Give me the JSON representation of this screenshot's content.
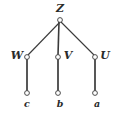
{
  "figure": {
    "type": "tree-diagram",
    "background_color": "#ffffff",
    "stroke_color": "#3a3a3a",
    "label_color": "#2a2a2a",
    "node_fill": "#ffffff"
  },
  "nodes": [
    {
      "id": "Z",
      "label": "Z",
      "cx": 60,
      "cy": 20,
      "r": 2.4,
      "label_x": 60,
      "label_y": 3,
      "label_anchor": "center",
      "level": "root",
      "size": "upper"
    },
    {
      "id": "W",
      "label": "W",
      "cx": 27,
      "cy": 57,
      "r": 2.4,
      "label_x": 17,
      "label_y": 50,
      "label_anchor": "center",
      "level": "internal",
      "size": "upper"
    },
    {
      "id": "V",
      "label": "V",
      "cx": 58,
      "cy": 57,
      "r": 2.4,
      "label_x": 68,
      "label_y": 50,
      "label_anchor": "center",
      "level": "internal",
      "size": "upper"
    },
    {
      "id": "U",
      "label": "U",
      "cx": 95,
      "cy": 57,
      "r": 2.4,
      "label_x": 105,
      "label_y": 50,
      "label_anchor": "center",
      "level": "internal",
      "size": "upper"
    },
    {
      "id": "c",
      "label": "c",
      "cx": 27,
      "cy": 93,
      "r": 2.4,
      "label_x": 27,
      "label_y": 99,
      "label_anchor": "center",
      "level": "leaf",
      "size": "lower"
    },
    {
      "id": "b",
      "label": "b",
      "cx": 58,
      "cy": 93,
      "r": 2.4,
      "label_x": 60,
      "label_y": 99,
      "label_anchor": "center",
      "level": "leaf",
      "size": "lower"
    },
    {
      "id": "a",
      "label": "a",
      "cx": 95,
      "cy": 93,
      "r": 2.4,
      "label_x": 97,
      "label_y": 99,
      "label_anchor": "center",
      "level": "leaf",
      "size": "lower"
    }
  ],
  "edges": [
    {
      "id": "Z-W",
      "from": "Z",
      "to": "W",
      "x1": 60,
      "y1": 22,
      "x2": 28,
      "y2": 55,
      "width": 1.1,
      "style": "diagonal"
    },
    {
      "id": "Z-V",
      "from": "Z",
      "to": "V",
      "x1": 59,
      "y1": 22,
      "x2": 58,
      "y2": 55,
      "width": 1.6,
      "style": "vertical"
    },
    {
      "id": "Z-U",
      "from": "Z",
      "to": "U",
      "x1": 61,
      "y1": 22,
      "x2": 94,
      "y2": 55,
      "width": 1.1,
      "style": "diagonal"
    },
    {
      "id": "W-c",
      "from": "W",
      "to": "c",
      "x1": 27,
      "y1": 59,
      "x2": 27,
      "y2": 91,
      "width": 1.7,
      "style": "vertical"
    },
    {
      "id": "V-b",
      "from": "V",
      "to": "b",
      "x1": 58,
      "y1": 59,
      "x2": 58,
      "y2": 91,
      "width": 1.7,
      "style": "vertical"
    },
    {
      "id": "U-a",
      "from": "U",
      "to": "a",
      "x1": 95,
      "y1": 59,
      "x2": 95,
      "y2": 91,
      "width": 1.7,
      "style": "vertical"
    }
  ]
}
